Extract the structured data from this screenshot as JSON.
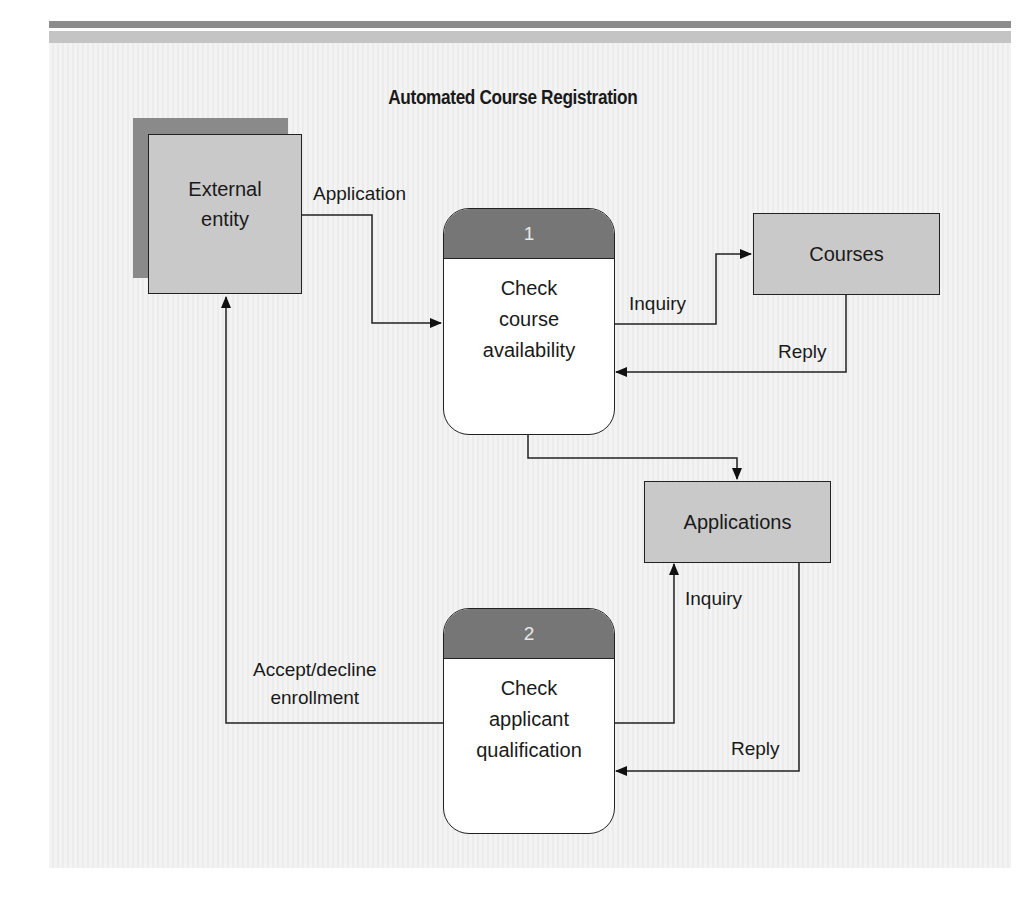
{
  "title": "Automated Course Registration",
  "nodes": {
    "external_entity": {
      "label": "External\nentity",
      "type": "external-entity"
    },
    "process_1": {
      "number": "1",
      "label": "Check\ncourse\navailability",
      "type": "process"
    },
    "process_2": {
      "number": "2",
      "label": "Check\napplicant\nqualification",
      "type": "process"
    },
    "courses": {
      "label": "Courses",
      "type": "data-store"
    },
    "applications": {
      "label": "Applications",
      "type": "data-store"
    }
  },
  "flows": {
    "application": {
      "label": "Application",
      "from": "External entity",
      "to": "Check course availability"
    },
    "inquiry_1": {
      "label": "Inquiry",
      "from": "Check course availability",
      "to": "Courses"
    },
    "reply_1": {
      "label": "Reply",
      "from": "Courses",
      "to": "Check course availability"
    },
    "to_applications": {
      "label": "",
      "from": "Check course availability",
      "to": "Applications"
    },
    "inquiry_2": {
      "label": "Inquiry",
      "from": "Check applicant qualification",
      "to": "Applications"
    },
    "reply_2": {
      "label": "Reply",
      "from": "Applications",
      "to": "Check applicant qualification"
    },
    "accept_decline": {
      "label": "Accept/decline\nenrollment",
      "from": "Check applicant qualification",
      "to": "External entity"
    }
  },
  "colors": {
    "shape_fill": "#c9c9c9",
    "shadow": "#8a8a8a",
    "process_header": "#767676",
    "line": "#222222"
  }
}
